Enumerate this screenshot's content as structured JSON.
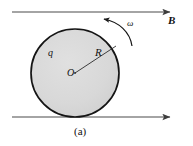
{
  "figure": {
    "caption": "(a)",
    "background_color": "#ffffff",
    "line_color": "#4a4a4a",
    "outline_color": "#1a1a1a",
    "disc_fill_color": "#d9d9d9",
    "labels": {
      "magnetic_field": "B",
      "angular_velocity": "ω",
      "charge": "q",
      "radius": "R",
      "center": "O"
    },
    "field_lines": [
      {
        "name": "top-field-line",
        "y": 12,
        "x_start": 12,
        "x_end": 172,
        "direction": "right"
      },
      {
        "name": "bottom-field-line",
        "y": 117,
        "x_start": 12,
        "x_end": 172,
        "direction": "right"
      }
    ],
    "disc": {
      "center_x": 75,
      "center_y": 73,
      "radius": 44
    },
    "rotation": {
      "sense": "counterclockwise"
    }
  }
}
